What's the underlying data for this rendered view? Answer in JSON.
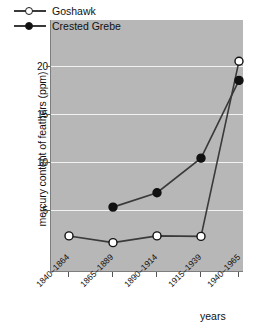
{
  "chart_data": {
    "type": "line",
    "title": "",
    "xlabel": "years",
    "ylabel": "mercury content of feathers (ppm)",
    "categories": [
      "1840–1864",
      "1865–1889",
      "1890–1914",
      "1915–1939",
      "1940–1965"
    ],
    "yticks": [
      5,
      10,
      15,
      20
    ],
    "ylim": [
      0,
      23
    ],
    "grid": "horizontal",
    "legend_position": "top-left",
    "plot_background": "#b7b7b7",
    "gridline_color": "#f2f2f2",
    "line_color": "#3a3a3a",
    "series": [
      {
        "name": "Goshawk",
        "marker": "open-circle",
        "marker_fill": "#ffffff",
        "values": [
          2.3,
          1.6,
          2.3,
          2.25,
          20.5
        ]
      },
      {
        "name": "Crested Grebe",
        "marker": "filled-circle",
        "marker_fill": "#111111",
        "values": [
          null,
          5.3,
          6.8,
          10.4,
          18.5
        ]
      }
    ]
  },
  "axis": {
    "y_title": "mercury content of feathers (ppm)",
    "x_title": "years",
    "y_tick_labels": [
      "20",
      "15",
      "10",
      "5"
    ],
    "x_tick_labels": [
      "1840–1864",
      "1865–1889",
      "1890–1914",
      "1915–1939",
      "1940–1965"
    ]
  },
  "legend": {
    "entries": [
      {
        "label": "Goshawk"
      },
      {
        "label": "Crested Grebe"
      }
    ]
  }
}
